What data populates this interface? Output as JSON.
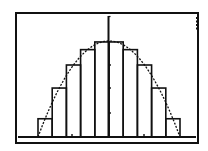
{
  "chart_data": {
    "type": "bar",
    "title": "",
    "xlabel": "",
    "ylabel": "",
    "grid": false,
    "legend": null,
    "axes": {
      "x_axis_y_px": 137,
      "y_axis_x_px": 108.5
    },
    "x_ticks_px": [
      72,
      144
    ],
    "y_ticks_px": [
      65,
      88,
      113
    ],
    "categories": [
      "1",
      "2",
      "3",
      "4",
      "5",
      "6",
      "7",
      "8",
      "9",
      "10"
    ],
    "values": [
      0.19,
      0.51,
      0.75,
      0.91,
      0.99,
      0.99,
      0.91,
      0.75,
      0.51,
      0.19
    ],
    "ylim": [
      0,
      1.0
    ],
    "series": [
      {
        "name": "rectangles",
        "type": "bar",
        "values": [
          0.19,
          0.51,
          0.75,
          0.91,
          0.99,
          0.99,
          0.91,
          0.75,
          0.51,
          0.19
        ]
      },
      {
        "name": "curve",
        "type": "line",
        "function": "y = 1 - x^2",
        "x_range": [
          -1,
          1
        ]
      }
    ]
  },
  "screen": {
    "frame": {
      "left": 16,
      "top": 13,
      "right": 198,
      "bottom": 143
    },
    "plot": {
      "x_min_px": 38,
      "x_max_px": 180,
      "peak_y_px": 41
    },
    "busy_indicator": true,
    "colors": {
      "background": "#ffffff",
      "ink": "#111111"
    }
  }
}
